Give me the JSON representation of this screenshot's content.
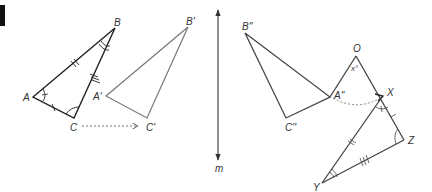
{
  "figure": {
    "tab_marker_color": "#111111",
    "colors": {
      "original": "#222222",
      "image": "#666666",
      "image2": "#444444",
      "final": "#444444",
      "dotted": "#777777"
    },
    "original_triangle": {
      "A": "A",
      "B": "B",
      "C": "C"
    },
    "translated_triangle": {
      "A": "A'",
      "B": "B'",
      "C": "C'"
    },
    "reflected_triangle": {
      "A": "A''",
      "B": "B''",
      "C": "C''"
    },
    "mirror_line": {
      "label": "m"
    },
    "rotation": {
      "center": "O",
      "angle": "x°"
    },
    "final_triangle": {
      "X": "X",
      "Y": "Y",
      "Z": "Z"
    }
  }
}
